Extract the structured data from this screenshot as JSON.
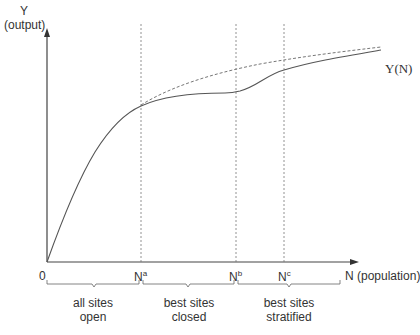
{
  "axes": {
    "y_label_line1": "Y",
    "y_label_line2": "(output)",
    "x_label": "N (population)",
    "origin_label": "0"
  },
  "ticks": [
    {
      "base": "N",
      "sup": "a"
    },
    {
      "base": "N",
      "sup": "b"
    },
    {
      "base": "N",
      "sup": "c"
    }
  ],
  "curve_label": "Y(N)",
  "regions": [
    {
      "line1": "all sites",
      "line2": "open"
    },
    {
      "line1": "best sites",
      "line2": "closed"
    },
    {
      "line1": "best sites",
      "line2": "stratified"
    }
  ],
  "colors": {
    "axis": "#444444",
    "curve": "#555555",
    "dashed": "#666666"
  }
}
